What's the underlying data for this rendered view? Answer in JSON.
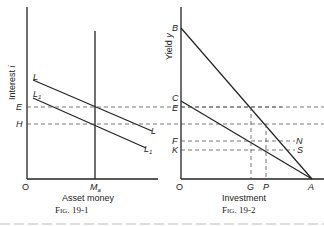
{
  "fig1": {
    "caption": "Fig. 19-1",
    "xlabel": "Asset money",
    "ylabel": "Interest i",
    "origin": "O",
    "x_marker": "Ma",
    "curves": [
      {
        "label": "L",
        "label_end": "L"
      },
      {
        "label": "L1",
        "label_end": "L1"
      }
    ],
    "levels": [
      "E",
      "H"
    ]
  },
  "fig2": {
    "caption": "Fig. 19-2",
    "xlabel": "Investment",
    "ylabel": "Yield y",
    "origin": "O",
    "y_points": [
      "B",
      "C",
      "E",
      "F",
      "K"
    ],
    "x_points": [
      "G",
      "P",
      "A"
    ],
    "right_labels": [
      "N",
      "S"
    ]
  }
}
